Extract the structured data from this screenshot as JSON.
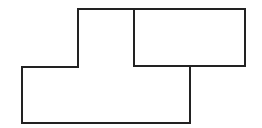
{
  "diagram": {
    "background": "#ffffff",
    "stroke_color": "#222222",
    "stroke_width": 2,
    "shapes": [
      {
        "name": "l-shaped-polygon",
        "points": "78,9 134,9 134,66 190,66 190,123 22,123 22,67 78,67"
      },
      {
        "name": "right-rectangle",
        "x": 134,
        "y": 9,
        "width": 111,
        "height": 57
      }
    ]
  }
}
